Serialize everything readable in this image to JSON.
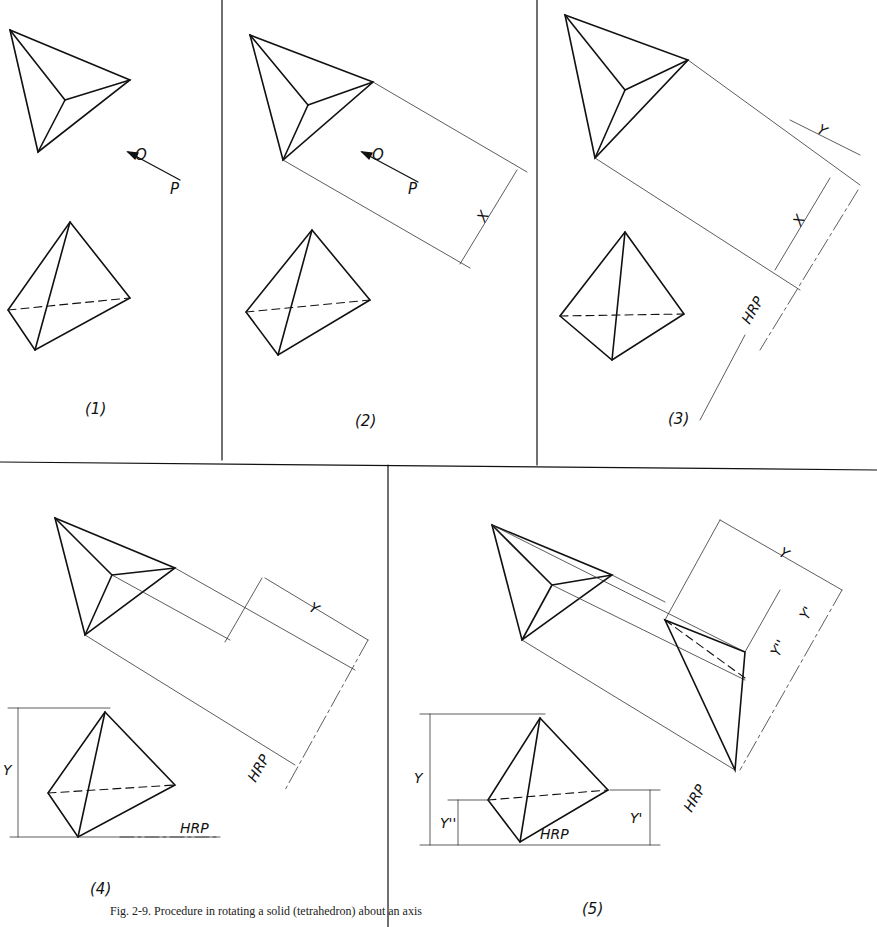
{
  "figure": {
    "caption": "Fig. 2-9. Procedure in rotating a solid (tetrahedron) about an axis",
    "panels": [
      {
        "id": "1",
        "label": "(1)",
        "point_labels": [
          "O",
          "P"
        ]
      },
      {
        "id": "2",
        "label": "(2)",
        "point_labels": [
          "O",
          "P"
        ],
        "dimension_labels": [
          "X"
        ]
      },
      {
        "id": "3",
        "label": "(3)",
        "dimension_labels": [
          "X",
          "Y"
        ],
        "reference_plane": "HRP"
      },
      {
        "id": "4",
        "label": "(4)",
        "dimension_labels": [
          "Y",
          "Y"
        ],
        "reference_plane_1": "HRP",
        "reference_plane_2": "HRP"
      },
      {
        "id": "5",
        "label": "(5)",
        "dimension_labels": [
          "Y",
          "Y'",
          "Y''",
          "Y",
          "Y''",
          "Y'"
        ],
        "reference_plane_1": "HRP",
        "reference_plane_2": "HRP"
      }
    ]
  },
  "colors": {
    "line": "#111111",
    "thin": "#333333",
    "background": "#ffffff"
  }
}
